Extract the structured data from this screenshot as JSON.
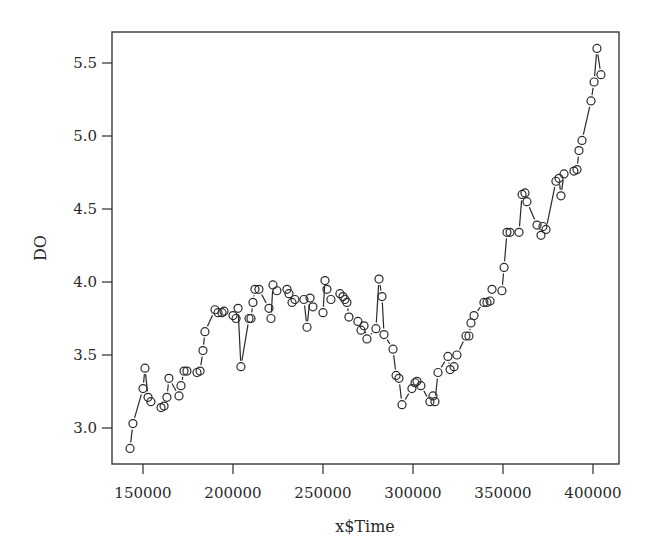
{
  "chart_data": {
    "type": "line",
    "style": "points-and-lines (type='b')",
    "title": "",
    "xlabel": "x$Time",
    "ylabel": "DO",
    "xlim": [
      138000,
      414000
    ],
    "ylim": [
      2.75,
      5.72
    ],
    "grid": false,
    "legend": null,
    "x_ticks": [
      150000,
      200000,
      250000,
      300000,
      350000,
      400000
    ],
    "x_tick_labels": [
      "150000",
      "200000",
      "250000",
      "300000",
      "350000",
      "400000"
    ],
    "y_ticks": [
      3.0,
      3.5,
      4.0,
      4.5,
      5.0,
      5.5
    ],
    "y_tick_labels": [
      "3.0",
      "3.5",
      "4.0",
      "4.5",
      "5.0",
      "5.5"
    ],
    "series": [
      {
        "name": "DO",
        "marker": "open-circle",
        "color": "#2a2a2a",
        "x": [
          142800,
          144400,
          150000,
          151100,
          152800,
          154400,
          160000,
          161700,
          163300,
          164400,
          170000,
          171100,
          172800,
          174400,
          180000,
          181700,
          183300,
          184400,
          190000,
          191700,
          193900,
          195000,
          200000,
          201700,
          202800,
          204400,
          208900,
          210000,
          211100,
          212200,
          214400,
          220000,
          221100,
          222200,
          224400,
          230000,
          231100,
          232800,
          234400,
          239400,
          241100,
          242800,
          244400,
          250000,
          251100,
          252200,
          254400,
          259400,
          261100,
          262200,
          263300,
          264400,
          269400,
          271100,
          272800,
          274400,
          279400,
          281100,
          282800,
          283900,
          288900,
          290600,
          292200,
          293900,
          299400,
          301100,
          302200,
          304400,
          309400,
          311100,
          312200,
          313900,
          319400,
          320600,
          322800,
          324400,
          329400,
          331100,
          332200,
          333900,
          339400,
          341100,
          342800,
          343900,
          349400,
          350600,
          352200,
          353900,
          358900,
          360600,
          362200,
          363300,
          368900,
          371100,
          372200,
          373900,
          379400,
          381100,
          382200,
          383900,
          389400,
          391100,
          392200,
          393900,
          398900,
          400600,
          402200,
          404400
        ],
        "y": [
          2.86,
          3.03,
          3.27,
          3.41,
          3.21,
          3.18,
          3.14,
          3.15,
          3.21,
          3.34,
          3.22,
          3.29,
          3.39,
          3.39,
          3.38,
          3.39,
          3.53,
          3.66,
          3.81,
          3.79,
          3.79,
          3.8,
          3.77,
          3.75,
          3.82,
          3.42,
          3.75,
          3.75,
          3.86,
          3.95,
          3.95,
          3.82,
          3.75,
          3.98,
          3.94,
          3.95,
          3.92,
          3.86,
          3.88,
          3.88,
          3.69,
          3.89,
          3.83,
          3.79,
          4.01,
          3.95,
          3.88,
          3.92,
          3.9,
          3.88,
          3.86,
          3.76,
          3.73,
          3.67,
          3.7,
          3.61,
          3.68,
          4.02,
          3.9,
          3.64,
          3.54,
          3.36,
          3.34,
          3.16,
          3.27,
          3.31,
          3.32,
          3.29,
          3.18,
          3.22,
          3.18,
          3.38,
          3.49,
          3.4,
          3.42,
          3.5,
          3.63,
          3.63,
          3.72,
          3.77,
          3.86,
          3.86,
          3.87,
          3.95,
          3.94,
          4.1,
          4.34,
          4.34,
          4.34,
          4.6,
          4.61,
          4.55,
          4.39,
          4.32,
          4.38,
          4.36,
          4.69,
          4.71,
          4.59,
          4.74,
          4.76,
          4.77,
          4.9,
          4.97,
          5.24,
          5.37,
          5.6,
          5.42
        ]
      }
    ]
  },
  "layout": {
    "plot_left": 112,
    "plot_right": 619,
    "plot_top": 32,
    "plot_bottom": 464,
    "x_ref": {
      "value": 150000,
      "px": 143,
      "px_per_50000": 90
    },
    "y_ref": {
      "value": 3.0,
      "px": 428,
      "px_per_0_5": 73
    },
    "marker_radius": 4,
    "ink_color": "#2a2a2a"
  }
}
